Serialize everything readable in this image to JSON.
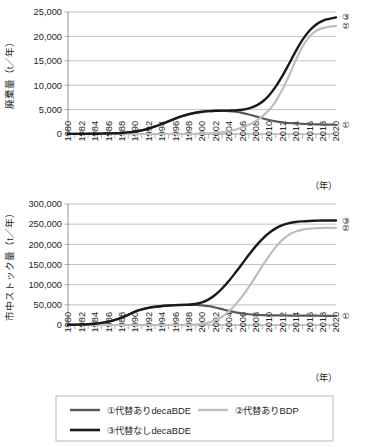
{
  "figure": {
    "title": "",
    "charts": [
      {
        "id": "waste-chart",
        "ylabel": "廃棄量（t／年）",
        "xlabel": "（年）",
        "ytick_labels": [
          "0",
          "5,000",
          "10,000",
          "15,000",
          "20,000",
          "25,000"
        ],
        "xtick_labels": [
          "1980",
          "1982",
          "1984",
          "1986",
          "1988",
          "1990",
          "1992",
          "1994",
          "1996",
          "1998",
          "2000",
          "2002",
          "2004",
          "2006",
          "2008",
          "2010",
          "2012",
          "2014",
          "2016",
          "2018",
          "2020"
        ],
        "series_tags": [
          "①",
          "②",
          "③"
        ]
      },
      {
        "id": "stock-chart",
        "ylabel": "市中ストック量（t／年）",
        "xlabel": "（年）",
        "ytick_labels": [
          "0",
          "50,000",
          "100,000",
          "150,000",
          "200,000",
          "250,000",
          "300,000"
        ],
        "xtick_labels": [
          "1980",
          "1982",
          "1984",
          "1986",
          "1988",
          "1990",
          "1992",
          "1994",
          "1996",
          "1998",
          "2000",
          "2002",
          "2004",
          "2006",
          "2008",
          "2010",
          "2012",
          "2014",
          "2016",
          "2018",
          "2020"
        ],
        "series_tags": [
          "①",
          "②",
          "③"
        ]
      }
    ],
    "legend": {
      "items": [
        {
          "marker": "①",
          "label": "①代替ありdecaBDE",
          "color": "#58595b"
        },
        {
          "marker": "②",
          "label": "②代替ありBDP",
          "color": "#bcbec0"
        },
        {
          "marker": "③",
          "label": "③代替なしdecaBDE",
          "color": "#1a1a1a"
        }
      ]
    }
  },
  "colors": {
    "series1": "#58595b",
    "series2": "#bcbec0",
    "series3": "#1a1a1a",
    "grid": "#a7a9ac",
    "axis": "#939598",
    "text": "#231f20",
    "background": "#ffffff"
  },
  "chart_data": [
    {
      "type": "line",
      "title": "廃棄量",
      "xlabel": "（年）",
      "ylabel": "廃棄量（t／年）",
      "xlim": [
        1980,
        2020
      ],
      "ylim": [
        0,
        25000
      ],
      "grid": true,
      "legend_position": "bottom",
      "x": [
        1980,
        1981,
        1982,
        1983,
        1984,
        1985,
        1986,
        1987,
        1988,
        1989,
        1990,
        1991,
        1992,
        1993,
        1994,
        1995,
        1996,
        1997,
        1998,
        1999,
        2000,
        2001,
        2002,
        2003,
        2004,
        2005,
        2006,
        2007,
        2008,
        2009,
        2010,
        2011,
        2012,
        2013,
        2014,
        2015,
        2016,
        2017,
        2018,
        2019,
        2020
      ],
      "series": [
        {
          "name": "①代替ありdecaBDE",
          "color": "#58595b",
          "values": [
            20,
            25,
            30,
            40,
            55,
            75,
            105,
            150,
            220,
            330,
            500,
            750,
            1100,
            1550,
            2050,
            2600,
            3150,
            3650,
            4050,
            4350,
            4550,
            4680,
            4750,
            4760,
            4700,
            4560,
            4330,
            4000,
            3620,
            3230,
            2880,
            2600,
            2400,
            2250,
            2150,
            2080,
            2020,
            1980,
            1950,
            1930,
            1900
          ]
        },
        {
          "name": "②代替ありBDP",
          "color": "#bcbec0",
          "values": [
            0,
            0,
            0,
            0,
            0,
            0,
            0,
            0,
            0,
            0,
            0,
            0,
            0,
            0,
            0,
            0,
            0,
            5,
            15,
            30,
            60,
            110,
            200,
            340,
            560,
            880,
            1320,
            1900,
            2650,
            3600,
            4900,
            6700,
            9100,
            12000,
            15100,
            17900,
            19900,
            21100,
            21700,
            22000,
            22100
          ]
        },
        {
          "name": "③代替なしdecaBDE",
          "color": "#1a1a1a",
          "values": [
            20,
            25,
            30,
            40,
            55,
            75,
            105,
            150,
            220,
            330,
            500,
            750,
            1100,
            1550,
            2050,
            2600,
            3150,
            3650,
            4050,
            4350,
            4550,
            4680,
            4750,
            4780,
            4800,
            4850,
            4980,
            5250,
            5750,
            6600,
            7900,
            9700,
            11900,
            14400,
            17000,
            19300,
            21100,
            22400,
            23200,
            23600,
            23900
          ]
        }
      ]
    },
    {
      "type": "line",
      "title": "市中ストック量",
      "xlabel": "（年）",
      "ylabel": "市中ストック量（t／年）",
      "xlim": [
        1980,
        2020
      ],
      "ylim": [
        0,
        300000
      ],
      "grid": true,
      "legend_position": "bottom",
      "x": [
        1980,
        1981,
        1982,
        1983,
        1984,
        1985,
        1986,
        1987,
        1988,
        1989,
        1990,
        1991,
        1992,
        1993,
        1994,
        1995,
        1996,
        1997,
        1998,
        1999,
        2000,
        2001,
        2002,
        2003,
        2004,
        2005,
        2006,
        2007,
        2008,
        2009,
        2010,
        2011,
        2012,
        2013,
        2014,
        2015,
        2016,
        2017,
        2018,
        2019,
        2020
      ],
      "series": [
        {
          "name": "①代替ありdecaBDE",
          "color": "#58595b",
          "values": [
            300,
            600,
            1100,
            1900,
            3200,
            5200,
            8200,
            12500,
            18200,
            25300,
            33000,
            38500,
            42400,
            45100,
            47000,
            48300,
            49200,
            49700,
            50000,
            49900,
            48800,
            46600,
            43300,
            39200,
            35100,
            31500,
            28700,
            26700,
            25400,
            24600,
            24100,
            23800,
            23600,
            23400,
            23300,
            23200,
            23100,
            23000,
            22900,
            22800,
            22700
          ]
        },
        {
          "name": "②代替ありBDP",
          "color": "#bcbec0",
          "values": [
            0,
            0,
            0,
            0,
            0,
            0,
            0,
            0,
            0,
            0,
            0,
            0,
            0,
            0,
            0,
            0,
            0,
            100,
            400,
            1100,
            2600,
            5800,
            11500,
            20500,
            33500,
            50500,
            71000,
            94500,
            120000,
            146000,
            171000,
            193000,
            211000,
            224000,
            232000,
            236500,
            239000,
            240000,
            240500,
            241000,
            241000
          ]
        },
        {
          "name": "③代替なしdecaBDE",
          "color": "#1a1a1a",
          "values": [
            300,
            600,
            1100,
            1900,
            3200,
            5200,
            8200,
            12500,
            18200,
            25300,
            33000,
            38500,
            42400,
            45100,
            47000,
            48300,
            49200,
            49700,
            50300,
            52000,
            56000,
            63500,
            75000,
            90500,
            109000,
            130000,
            152000,
            174000,
            195000,
            213000,
            228000,
            239500,
            247500,
            252500,
            255500,
            257000,
            258000,
            258500,
            259000,
            259000,
            259000
          ]
        }
      ]
    }
  ]
}
